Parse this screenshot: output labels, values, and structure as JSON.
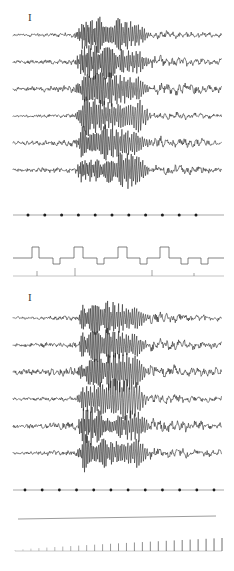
{
  "figure": {
    "kind": "multichannel-biosignal-recording",
    "background_color": "#ffffff",
    "ink_color": "#1e1e1e",
    "faint_ink_color": "#9a9a9a",
    "width": 234,
    "height": 571
  },
  "calibration_markers": [
    {
      "name": "panel-1-calibration-bar",
      "label": "I",
      "x": 28,
      "y": 12
    },
    {
      "name": "panel-2-calibration-bar",
      "label": "I",
      "x": 28,
      "y": 292
    }
  ],
  "panels": [
    {
      "id": "panel-1",
      "label": "",
      "baseline_top": 35,
      "row_spacing": 27,
      "channel_count": 6,
      "trace_x_start": 13,
      "trace_x_end": 222,
      "burst_x_start": 74,
      "burst_x_end": 152,
      "channels": [
        {
          "name": "channel-1",
          "baseline_y": 35,
          "noise_amp": 1.6,
          "burst_amp": 15,
          "burst_freq": 13,
          "post_amp": 1.8
        },
        {
          "name": "channel-2",
          "baseline_y": 62,
          "noise_amp": 1.9,
          "burst_amp": 14,
          "burst_freq": 13,
          "post_amp": 2.4
        },
        {
          "name": "channel-3",
          "baseline_y": 89,
          "noise_amp": 2.6,
          "burst_amp": 14,
          "burst_freq": 12,
          "post_amp": 2.6
        },
        {
          "name": "channel-4",
          "baseline_y": 116,
          "noise_amp": 1.4,
          "burst_amp": 16,
          "burst_freq": 11,
          "post_amp": 1.7
        },
        {
          "name": "channel-5",
          "baseline_y": 143,
          "noise_amp": 2.3,
          "burst_amp": 15,
          "burst_freq": 12,
          "post_amp": 2.5
        },
        {
          "name": "channel-6",
          "baseline_y": 170,
          "noise_amp": 2.2,
          "burst_amp": 14,
          "burst_freq": 13,
          "post_amp": 2.3
        }
      ]
    },
    {
      "id": "panel-2",
      "label": "",
      "baseline_top": 315,
      "row_spacing": 27,
      "channel_count": 6,
      "trace_x_start": 13,
      "trace_x_end": 222,
      "burst_x_start": 76,
      "burst_x_end": 150,
      "channels": [
        {
          "name": "channel-1",
          "baseline_y": 318,
          "noise_amp": 1.5,
          "burst_amp": 14,
          "burst_freq": 12,
          "post_amp": 2.2
        },
        {
          "name": "channel-2",
          "baseline_y": 345,
          "noise_amp": 2.2,
          "burst_amp": 14,
          "burst_freq": 12,
          "post_amp": 2.4
        },
        {
          "name": "channel-3",
          "baseline_y": 372,
          "noise_amp": 3.0,
          "burst_amp": 15,
          "burst_freq": 12,
          "post_amp": 2.8
        },
        {
          "name": "channel-4",
          "baseline_y": 399,
          "noise_amp": 1.8,
          "burst_amp": 17,
          "burst_freq": 10,
          "post_amp": 2.0
        },
        {
          "name": "channel-5",
          "baseline_y": 426,
          "noise_amp": 2.6,
          "burst_amp": 15,
          "burst_freq": 13,
          "post_amp": 2.8
        },
        {
          "name": "channel-6",
          "baseline_y": 453,
          "noise_amp": 2.1,
          "burst_amp": 14,
          "burst_freq": 12,
          "post_amp": 2.4
        }
      ]
    }
  ],
  "marker_traces": [
    {
      "name": "timing-dot-trace-upper",
      "baseline_y": 215,
      "x_start": 13,
      "x_end": 224,
      "dot_count": 11,
      "dot_first_x": 28,
      "dot_last_x": 196,
      "dot_radius": 1.5
    },
    {
      "name": "timing-dot-trace-lower",
      "baseline_y": 490,
      "x_start": 13,
      "x_end": 224,
      "dot_count": 12,
      "dot_first_x": 25,
      "dot_last_x": 214,
      "dot_radius": 1.4
    }
  ],
  "square_wave_trace": {
    "name": "stimulus-square-wave-trace",
    "baseline_y": 258,
    "x_start": 13,
    "x_end": 224,
    "tall_pulse_height": 11,
    "short_pulse_dip": 6,
    "pulses": [
      {
        "x": 32,
        "w": 7,
        "type": "tall"
      },
      {
        "x": 53,
        "w": 7,
        "type": "short"
      },
      {
        "x": 74,
        "w": 9,
        "type": "tall"
      },
      {
        "x": 97,
        "w": 7,
        "type": "short"
      },
      {
        "x": 118,
        "w": 9,
        "type": "tall"
      },
      {
        "x": 140,
        "w": 7,
        "type": "short"
      },
      {
        "x": 160,
        "w": 9,
        "type": "tall"
      },
      {
        "x": 181,
        "w": 7,
        "type": "short"
      },
      {
        "x": 201,
        "w": 7,
        "type": "short"
      }
    ]
  },
  "event_trace": {
    "name": "event-marker-trace",
    "baseline_y": 276,
    "x_start": 13,
    "x_end": 224,
    "events": [
      {
        "x": 37,
        "height": 5
      },
      {
        "x": 75,
        "height": 8
      },
      {
        "x": 152,
        "height": 6
      },
      {
        "x": 194,
        "height": 3
      }
    ]
  },
  "flat_trace": {
    "name": "flat-baseline-trace",
    "y_left": 519,
    "y_right": 516,
    "x_start": 18,
    "x_end": 216
  },
  "comb_trace": {
    "name": "ramp-comb-trace",
    "baseline_y": 551,
    "x_start": 15,
    "x_end": 222,
    "tick_count": 27,
    "tick_min_height": 1,
    "tick_max_height": 13,
    "tick_spacing": 7.7
  },
  "chart_data": {
    "type": "line",
    "title": "",
    "subtitle": "",
    "xlabel": "",
    "ylabel": "",
    "grid": false,
    "legend_position": "none",
    "channel_labels": [
      "I",
      "I"
    ],
    "series": [
      {
        "name": "panel-1-channel-1",
        "values": []
      },
      {
        "name": "panel-1-channel-2",
        "values": []
      },
      {
        "name": "panel-1-channel-3",
        "values": []
      },
      {
        "name": "panel-1-channel-4",
        "values": []
      },
      {
        "name": "panel-1-channel-5",
        "values": []
      },
      {
        "name": "panel-1-channel-6",
        "values": []
      },
      {
        "name": "panel-1-timing-dots",
        "values": []
      },
      {
        "name": "panel-1-square-wave",
        "values": []
      },
      {
        "name": "panel-1-event-marks",
        "values": []
      },
      {
        "name": "panel-2-channel-1",
        "values": []
      },
      {
        "name": "panel-2-channel-2",
        "values": []
      },
      {
        "name": "panel-2-channel-3",
        "values": []
      },
      {
        "name": "panel-2-channel-4",
        "values": []
      },
      {
        "name": "panel-2-channel-5",
        "values": []
      },
      {
        "name": "panel-2-channel-6",
        "values": []
      },
      {
        "name": "panel-2-timing-dots",
        "values": []
      },
      {
        "name": "panel-2-flat-baseline",
        "values": []
      },
      {
        "name": "panel-2-ramp-comb",
        "values": []
      }
    ]
  }
}
